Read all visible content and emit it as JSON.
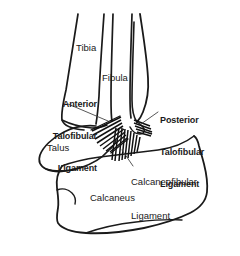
{
  "figure": {
    "background_color": "#ffffff",
    "ink_color": "#1a1a1a",
    "width": 240,
    "height": 256
  },
  "bones": [
    {
      "id": "tibia",
      "label": "Tibia",
      "x": 76,
      "y": 42
    },
    {
      "id": "fibula",
      "label": "Fibula",
      "x": 102,
      "y": 72
    },
    {
      "id": "talus",
      "label": "Talus",
      "x": 47,
      "y": 142
    },
    {
      "id": "calcaneus",
      "label": "Calcaneus",
      "x": 90,
      "y": 192
    }
  ],
  "ligaments": [
    {
      "id": "anterior-talofibular-ligament",
      "lines": [
        "Anterior",
        "Talofibular",
        "Ligament"
      ],
      "line1": "Anterior",
      "line2": "Talofibular",
      "line3": "Ligament",
      "emphasis": "bold",
      "align": "right",
      "x": 12,
      "y": 78
    },
    {
      "id": "posterior-talofibular-ligament",
      "lines": [
        "Posterior",
        "Talofibular",
        "Ligament"
      ],
      "line1": "Posterior",
      "line2": "Talofibular",
      "line3": "Ligament",
      "emphasis": "bold",
      "align": "left",
      "x": 160,
      "y": 94
    },
    {
      "id": "calcaneofibular-ligament",
      "lines": [
        "Calcaneofibular",
        "Ligament"
      ],
      "line1": "Calcaneofibular",
      "line2": "Ligament",
      "emphasis": "regular",
      "align": "left",
      "x": 131,
      "y": 154
    }
  ]
}
